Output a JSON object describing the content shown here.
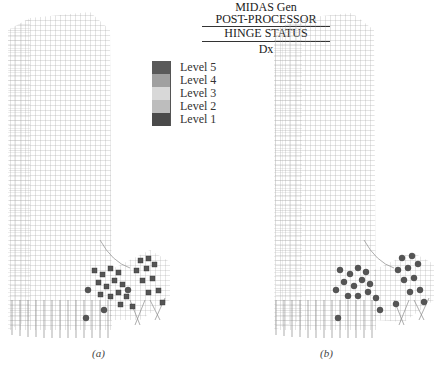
{
  "figure": {
    "panels": [
      {
        "id": "a",
        "caption": "(a)"
      },
      {
        "id": "b",
        "caption": "(b)"
      }
    ],
    "legend": {
      "program": "MIDAS Gen",
      "module": "POST-PROCESSOR",
      "result_type": "HINGE STATUS",
      "component": "Dx",
      "items": [
        {
          "label": "Level 5",
          "color": "#5a5a5a"
        },
        {
          "label": "Level 4",
          "color": "#a0a0a0"
        },
        {
          "label": "Level 3",
          "color": "#d8d8d8"
        },
        {
          "label": "Level 2",
          "color": "#bdbdbd"
        },
        {
          "label": "Level 1",
          "color": "#4a4a4a"
        }
      ]
    },
    "colors": {
      "frame_line": "#9a9a9a",
      "hinge_marker": "#555555",
      "background": "#ffffff"
    }
  }
}
